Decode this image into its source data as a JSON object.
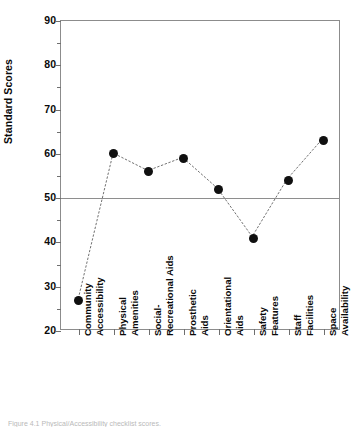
{
  "chart_data": {
    "type": "line",
    "title": "",
    "xlabel": "",
    "ylabel": "Standard Scores",
    "ylim": [
      20,
      90
    ],
    "ytick_step": 10,
    "yminor_step": 5,
    "grid": false,
    "legend": null,
    "marker": "filled-circle",
    "line_style": "dotted",
    "reference_line": {
      "value": 50,
      "orientation": "horizontal",
      "color": "#8e8e8e"
    },
    "yticks": [
      20,
      30,
      40,
      50,
      60,
      70,
      80,
      90
    ],
    "ytick_labels": [
      "20",
      "30",
      "40",
      "50",
      "60",
      "70",
      "80",
      "90"
    ],
    "categories": [
      "Community Accessibility",
      "Physical Amenities",
      "Social-Recreational Aids",
      "Prosthetic Aids",
      "Orientational Aids",
      "Safety Features",
      "Staff Facilities",
      "Space Availability"
    ],
    "category_lines": [
      [
        "Community",
        "Accessibility"
      ],
      [
        "Physical",
        "Amenities"
      ],
      [
        "Social-",
        "Recreational Aids"
      ],
      [
        "Prosthetic",
        "Aids"
      ],
      [
        "Orientational",
        "Aids"
      ],
      [
        "Safety",
        "Features"
      ],
      [
        "Staff",
        "Facilities"
      ],
      [
        "Space",
        "Availability"
      ]
    ],
    "values": [
      27,
      60,
      56,
      59,
      52,
      41,
      54,
      63
    ],
    "colors": {
      "marker": "#101010",
      "line": "#707070",
      "axis": "#8c8c8c",
      "text": "#0a0a0a",
      "reference": "#8e8e8e"
    }
  },
  "caption": {
    "text": "Figure 4.1   Physical/Accessibility checklist scores."
  }
}
